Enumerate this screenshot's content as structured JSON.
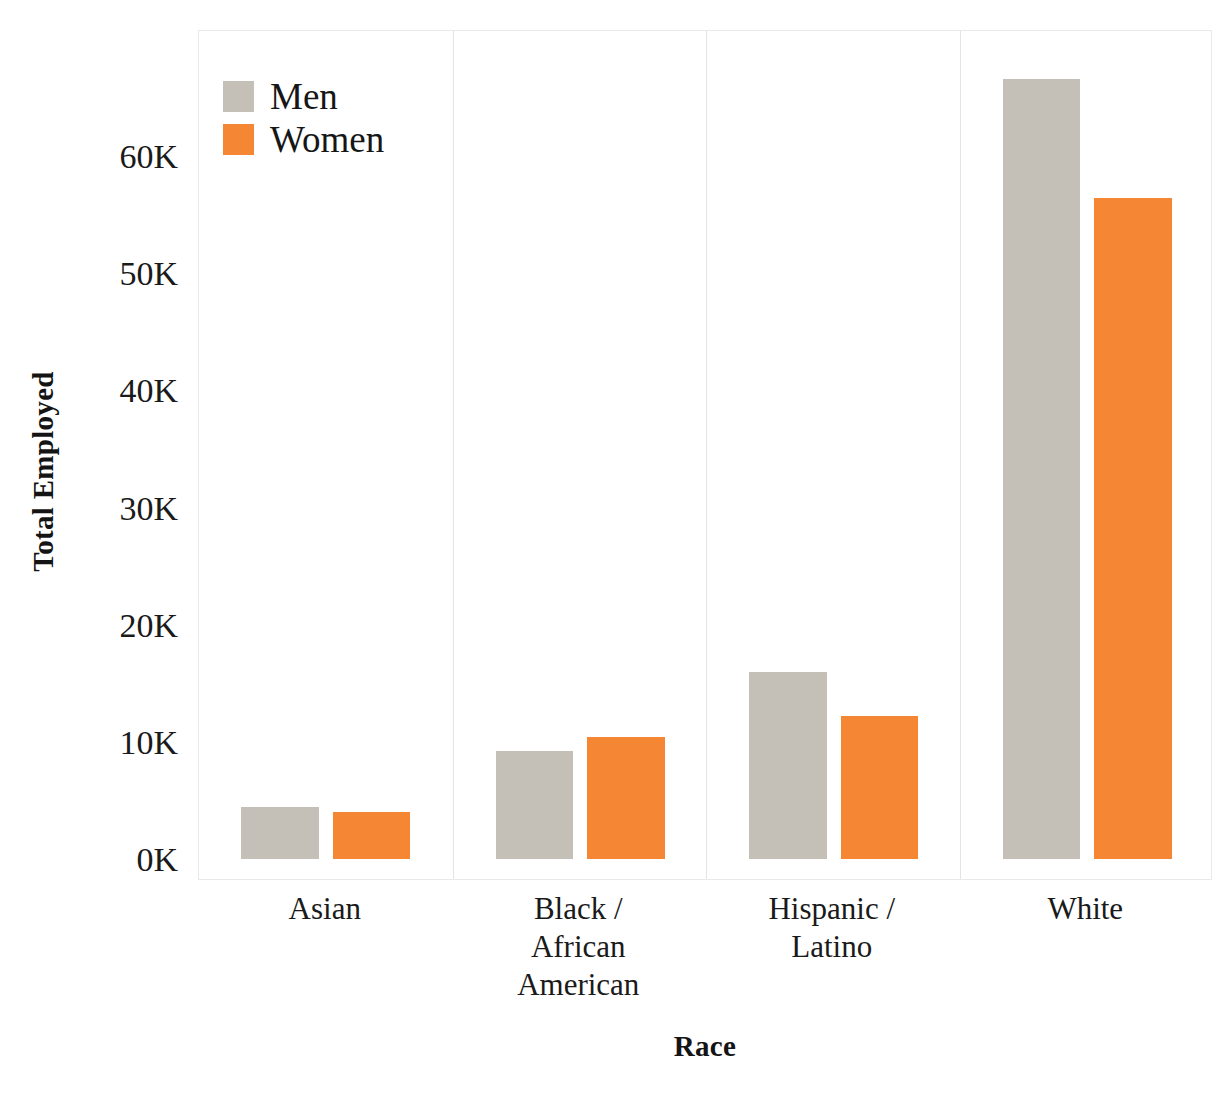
{
  "chart_data": {
    "type": "bar",
    "title": "",
    "xlabel": "Race",
    "ylabel": "Total Employed",
    "categories": [
      "Asian",
      "Black / African American",
      "Hispanic / Latino",
      "White"
    ],
    "category_lines": [
      [
        "Asian"
      ],
      [
        "Black /",
        "African",
        "American"
      ],
      [
        "Hispanic /",
        "Latino"
      ],
      [
        "White"
      ]
    ],
    "series": [
      {
        "name": "Men",
        "color": "#c4c0b8",
        "values": [
          4400,
          9200,
          16000,
          66600
        ]
      },
      {
        "name": "Women",
        "color": "#f58634",
        "values": [
          4000,
          10400,
          12200,
          56400
        ]
      }
    ],
    "ylim": [
      0,
      70000
    ],
    "yticks": [
      0,
      10000,
      20000,
      30000,
      40000,
      50000,
      60000
    ],
    "ytick_labels": [
      "0K",
      "10K",
      "20K",
      "30K",
      "40K",
      "50K",
      "60K"
    ],
    "grid": false,
    "legend_position": "top-left-inside",
    "faceted": true,
    "panel_separator_color": "#e4e4e4",
    "plot_border_color": "#e9e9e9",
    "background": "#ffffff"
  },
  "legend": {
    "items": [
      {
        "label": "Men",
        "swatch": "men-swatch"
      },
      {
        "label": "Women",
        "swatch": "women-swatch"
      }
    ]
  },
  "axes": {
    "y_title": "Total Employed",
    "x_title": "Race"
  }
}
